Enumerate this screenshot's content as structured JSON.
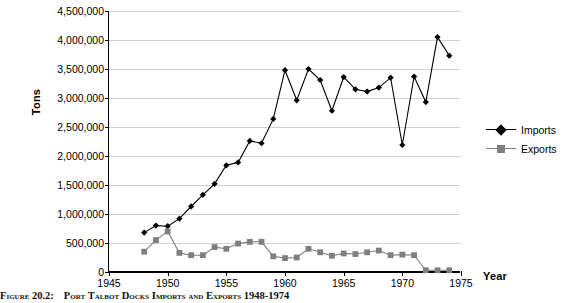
{
  "chart_data": {
    "type": "line",
    "title": "Port Talbot Docks Imports and Exports 1948-1974",
    "xlabel": "Year",
    "ylabel": "Tons",
    "xlim": [
      1945,
      1975
    ],
    "ylim": [
      0,
      4500000
    ],
    "xtick_step": 5,
    "ytick_step": 500000,
    "grid": true,
    "legend_position": "right",
    "x": [
      1948,
      1949,
      1950,
      1951,
      1952,
      1953,
      1954,
      1955,
      1956,
      1957,
      1958,
      1959,
      1960,
      1961,
      1962,
      1963,
      1964,
      1965,
      1966,
      1967,
      1968,
      1969,
      1970,
      1971,
      1972,
      1973,
      1974
    ],
    "series": [
      {
        "name": "Imports",
        "marker": "diamond",
        "color": "#000000",
        "values": [
          680000,
          800000,
          790000,
          920000,
          1130000,
          1330000,
          1520000,
          1840000,
          1890000,
          2260000,
          2220000,
          2640000,
          3480000,
          2960000,
          3500000,
          3310000,
          2780000,
          3360000,
          3150000,
          3110000,
          3180000,
          3350000,
          2190000,
          3370000,
          2930000,
          4050000,
          3730000
        ]
      },
      {
        "name": "Exports",
        "marker": "square",
        "color": "#7f7f7f",
        "values": [
          350000,
          550000,
          700000,
          330000,
          290000,
          290000,
          430000,
          400000,
          490000,
          520000,
          520000,
          270000,
          240000,
          250000,
          400000,
          340000,
          280000,
          320000,
          310000,
          340000,
          370000,
          290000,
          300000,
          290000,
          30000,
          30000,
          30000
        ]
      }
    ],
    "xtick_labels": [
      "1945",
      "1950",
      "1955",
      "1960",
      "1965",
      "1970",
      "1975"
    ],
    "ytick_labels": [
      "0",
      "500,000",
      "1,000,000",
      "1,500,000",
      "2,000,000",
      "2,500,000",
      "3,000,000",
      "3,500,000",
      "4,000,000",
      "4,500,000"
    ]
  },
  "legend": {
    "items": [
      {
        "label": "Imports"
      },
      {
        "label": "Exports"
      }
    ]
  },
  "caption": {
    "figure_number": "Figure 20.2:",
    "text": "Port Talbot Docks Imports and Exports 1948-1974"
  }
}
